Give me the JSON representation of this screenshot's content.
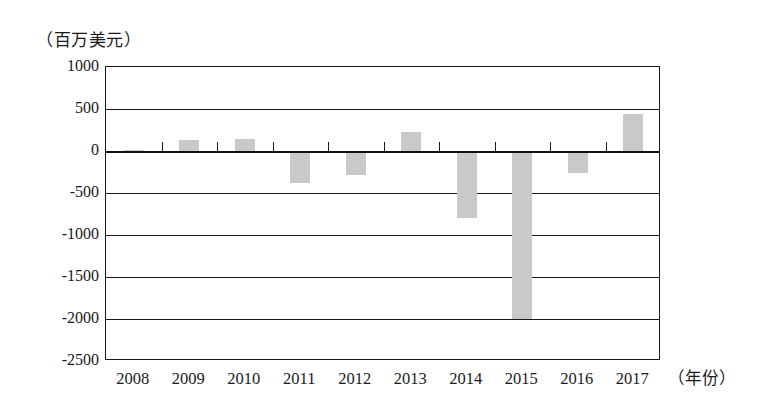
{
  "chart_data": {
    "type": "bar",
    "title": "",
    "subtitle": "",
    "xlabel": "（年份）",
    "ylabel": "（百万美元）",
    "categories": [
      "2008",
      "2009",
      "2010",
      "2011",
      "2012",
      "2013",
      "2014",
      "2015",
      "2016",
      "2017"
    ],
    "values": [
      10,
      130,
      140,
      -380,
      -280,
      225,
      -800,
      -2000,
      -265,
      440
    ],
    "series": [
      {
        "name": "",
        "values": [
          10,
          130,
          140,
          -380,
          -280,
          225,
          -800,
          -2000,
          -265,
          440
        ]
      }
    ],
    "ylim": [
      -2500,
      1000
    ],
    "ytick_labels": [
      "1000",
      "500",
      "0",
      "-500",
      "-1000",
      "-1500",
      "-2000",
      "-2500"
    ],
    "ytick_values": [
      1000,
      500,
      0,
      -500,
      -1000,
      -1500,
      -2000,
      -2500
    ],
    "grid": true,
    "legend": false,
    "legend_position": "none",
    "bar_color": "#c9c9c9",
    "axis_color": "#1a1a1a",
    "background_color": "#ffffff"
  },
  "axis": {
    "y_unit_caption": "（百万美元）",
    "x_unit_caption": "（年份）"
  }
}
